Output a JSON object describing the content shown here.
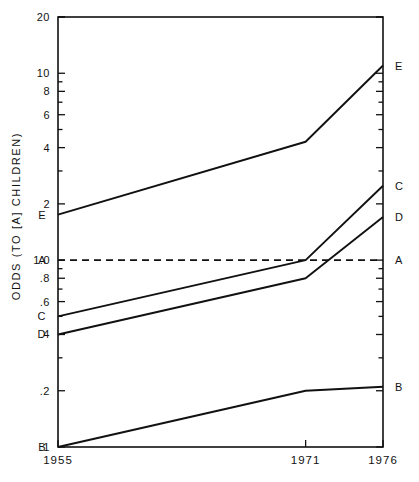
{
  "axes": {
    "ylabel": "ODDS  (TO [A] CHILDREN)",
    "y_ticks_labeled": [
      "20",
      "10",
      "8",
      "6",
      "4",
      "2",
      "1.0",
      ".8",
      ".6",
      ".4",
      ".2",
      ".1"
    ],
    "x_ticks_labeled": [
      "1955",
      "1971",
      "1976"
    ]
  },
  "series_end_labels": {
    "left": [
      "E",
      "A",
      "C",
      "D",
      "B"
    ],
    "right": [
      "E",
      "C",
      "D",
      "A",
      "B"
    ]
  },
  "chart_data": {
    "type": "line",
    "title": "",
    "xlabel": "",
    "ylabel": "ODDS  (TO [A] CHILDREN)",
    "x": [
      1955,
      1971,
      1976
    ],
    "xlim": [
      1955,
      1976
    ],
    "ylim": [
      0.1,
      20
    ],
    "yscale": "log",
    "grid": false,
    "legend": "endpoint-labels",
    "ytick_values": [
      20,
      10,
      8,
      6,
      4,
      2,
      1.0,
      0.8,
      0.6,
      0.4,
      0.2,
      0.1
    ],
    "ytick_labels": [
      "20",
      "10",
      "8",
      "6",
      "4",
      "2",
      "1.0",
      ".8",
      ".6",
      ".4",
      ".2",
      ".1"
    ],
    "xtick_values": [
      1955,
      1971,
      1976
    ],
    "xtick_labels": [
      "1955",
      "1971",
      "1976"
    ],
    "series": [
      {
        "name": "E",
        "style": "solid",
        "values": [
          1.75,
          4.3,
          11.0
        ]
      },
      {
        "name": "A",
        "style": "dashed",
        "values": [
          1.0,
          1.0,
          1.0
        ]
      },
      {
        "name": "C",
        "style": "solid",
        "values": [
          0.5,
          1.0,
          2.5
        ]
      },
      {
        "name": "D",
        "style": "solid",
        "values": [
          0.4,
          0.8,
          1.7
        ]
      },
      {
        "name": "B",
        "style": "solid",
        "values": [
          0.1,
          0.2,
          0.21
        ]
      }
    ]
  }
}
